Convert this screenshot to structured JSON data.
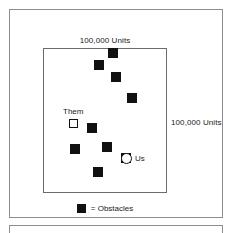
{
  "figure": {
    "background_color": "#ffffff",
    "frame_color": "#8d8d8d",
    "arena_border_color": "#6b6b6b",
    "obstacle_color": "#111111"
  },
  "dimensions": {
    "top_label": "100,000 Units",
    "right_label": "100,000 Units"
  },
  "entities": {
    "them": {
      "label": "Them",
      "marker": "open-square",
      "x": 68,
      "y": 118
    },
    "us": {
      "label": "Us",
      "marker": "open-circle",
      "x": 120,
      "y": 152
    }
  },
  "obstacles": {
    "marker": "filled-square",
    "count": 9,
    "items": [
      {
        "x": 107,
        "y": 47
      },
      {
        "x": 93,
        "y": 59
      },
      {
        "x": 110,
        "y": 71
      },
      {
        "x": 126,
        "y": 92
      },
      {
        "x": 86,
        "y": 122
      },
      {
        "x": 69,
        "y": 143
      },
      {
        "x": 101,
        "y": 141
      },
      {
        "x": 92,
        "y": 166
      },
      {
        "x": 120,
        "y": 152
      }
    ]
  },
  "legend": {
    "swatch": "filled-square",
    "text": "= Obstacles"
  }
}
